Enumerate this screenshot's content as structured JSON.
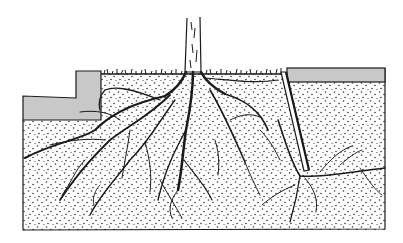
{
  "figure": {
    "description": "Cross-section illustration of a tree's root system spreading through stippled soil beneath pavement slabs; a root barrier on the right deflects roots downward",
    "caption": ""
  },
  "colors": {
    "background": "#ffffff",
    "ink": "#1a1a1a",
    "pavement": "#c8c8c8",
    "soil_dot": "#333333"
  },
  "elements": {
    "soil": {
      "label": "soil-cross-section",
      "x": 23,
      "y": 70,
      "w": 362,
      "h": 160
    },
    "left_curb": {
      "label": "left-pavement-curb-L"
    },
    "right_slab": {
      "label": "right-pavement-slab",
      "x": 287,
      "y": 68,
      "w": 98,
      "h": 14
    },
    "barrier": {
      "label": "root-barrier",
      "x1": 283,
      "y1": 72,
      "x2": 307,
      "y2": 170
    },
    "trunk": {
      "label": "tree-trunk",
      "x": 186,
      "top": 18,
      "width": 15
    },
    "grass": {
      "label": "grass-strip",
      "x1": 101,
      "x2": 283,
      "y": 72
    }
  }
}
